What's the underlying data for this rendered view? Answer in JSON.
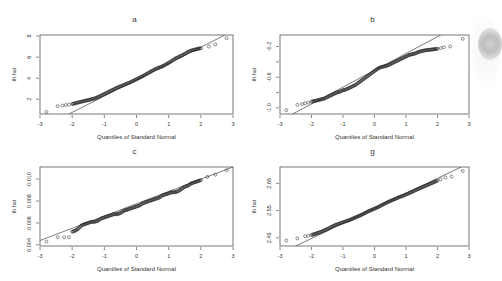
{
  "figure": {
    "layout": "2x2 grid of normal Q-Q plots",
    "colors": {
      "frame": "#555555",
      "points": "#222222",
      "line": "#444444",
      "text": "#333333"
    }
  },
  "chart_data": [
    {
      "type": "scatter",
      "panel": "a",
      "title": "a",
      "xlabel": "Quantiles of Standard Normal",
      "ylabel": "th.hat",
      "xlim": [
        -3,
        3
      ],
      "ylim": [
        0.6,
        8.1
      ],
      "xticks": [
        "-3",
        "-2",
        "-1",
        "0",
        "1",
        "2",
        "3"
      ],
      "yticks": [
        "2",
        "4",
        "6",
        "8"
      ],
      "reference_line": {
        "x": [
          -2.1,
          2.75
        ],
        "y": [
          0.6,
          8.1
        ]
      },
      "points_summary": "Q-Q points from about (-2.8, 0.8) to (2.8, 7.8); lower tail flatter than line, near-linear center, upper tail slightly below line",
      "points": [
        [
          -2.8,
          0.8
        ],
        [
          -2.45,
          1.35
        ],
        [
          -2.3,
          1.4
        ],
        [
          -2.2,
          1.45
        ],
        [
          -2.1,
          1.5
        ],
        [
          -2.0,
          1.55
        ],
        [
          -1.9,
          1.62
        ],
        [
          -1.8,
          1.7
        ],
        [
          -1.7,
          1.78
        ],
        [
          -1.6,
          1.85
        ],
        [
          -1.5,
          1.92
        ],
        [
          -1.4,
          2.0
        ],
        [
          -1.3,
          2.08
        ],
        [
          -1.2,
          2.2
        ],
        [
          -1.1,
          2.35
        ],
        [
          -1.0,
          2.5
        ],
        [
          -0.9,
          2.65
        ],
        [
          -0.8,
          2.8
        ],
        [
          -0.7,
          2.95
        ],
        [
          -0.6,
          3.1
        ],
        [
          -0.5,
          3.22
        ],
        [
          -0.4,
          3.35
        ],
        [
          -0.3,
          3.48
        ],
        [
          -0.2,
          3.6
        ],
        [
          -0.1,
          3.75
        ],
        [
          0.0,
          3.9
        ],
        [
          0.1,
          4.05
        ],
        [
          0.2,
          4.2
        ],
        [
          0.3,
          4.38
        ],
        [
          0.4,
          4.55
        ],
        [
          0.5,
          4.72
        ],
        [
          0.6,
          4.88
        ],
        [
          0.7,
          5.0
        ],
        [
          0.8,
          5.12
        ],
        [
          0.9,
          5.28
        ],
        [
          1.0,
          5.45
        ],
        [
          1.1,
          5.65
        ],
        [
          1.2,
          5.85
        ],
        [
          1.3,
          6.0
        ],
        [
          1.4,
          6.15
        ],
        [
          1.5,
          6.3
        ],
        [
          1.6,
          6.5
        ],
        [
          1.7,
          6.62
        ],
        [
          1.8,
          6.7
        ],
        [
          1.9,
          6.78
        ],
        [
          2.0,
          6.85
        ],
        [
          2.25,
          7.0
        ],
        [
          2.45,
          7.2
        ],
        [
          2.8,
          7.8
        ]
      ]
    },
    {
      "type": "scatter",
      "panel": "b",
      "title": "b",
      "xlabel": "Quantiles of Standard Normal",
      "ylabel": "th.hat",
      "xlim": [
        -3,
        3
      ],
      "ylim": [
        -1.08,
        -0.05
      ],
      "xticks": [
        "-3",
        "-2",
        "-1",
        "0",
        "1",
        "2",
        "3"
      ],
      "yticks": [
        "-1.0",
        "-0.6",
        "-0.2"
      ],
      "yticks_minor": [
        "-0.8",
        "-0.4"
      ],
      "reference_line": {
        "x": [
          -2.6,
          2.1
        ],
        "y": [
          -1.08,
          -0.05
        ]
      },
      "points_summary": "Q-Q points from about (-2.8, -1.03) to (2.8, -0.1); upper tail bends below reference line",
      "points": [
        [
          -2.8,
          -1.03
        ],
        [
          -2.45,
          -0.96
        ],
        [
          -2.3,
          -0.95
        ],
        [
          -2.2,
          -0.94
        ],
        [
          -2.1,
          -0.93
        ],
        [
          -2.0,
          -0.92
        ],
        [
          -1.9,
          -0.91
        ],
        [
          -1.8,
          -0.9
        ],
        [
          -1.7,
          -0.89
        ],
        [
          -1.6,
          -0.88
        ],
        [
          -1.5,
          -0.86
        ],
        [
          -1.4,
          -0.84
        ],
        [
          -1.3,
          -0.82
        ],
        [
          -1.2,
          -0.8
        ],
        [
          -1.1,
          -0.79
        ],
        [
          -1.0,
          -0.77
        ],
        [
          -0.9,
          -0.76
        ],
        [
          -0.8,
          -0.74
        ],
        [
          -0.7,
          -0.72
        ],
        [
          -0.6,
          -0.7
        ],
        [
          -0.5,
          -0.67
        ],
        [
          -0.4,
          -0.64
        ],
        [
          -0.3,
          -0.61
        ],
        [
          -0.2,
          -0.58
        ],
        [
          -0.1,
          -0.55
        ],
        [
          0.0,
          -0.52
        ],
        [
          0.1,
          -0.49
        ],
        [
          0.2,
          -0.47
        ],
        [
          0.3,
          -0.46
        ],
        [
          0.4,
          -0.45
        ],
        [
          0.5,
          -0.43
        ],
        [
          0.6,
          -0.41
        ],
        [
          0.7,
          -0.39
        ],
        [
          0.8,
          -0.37
        ],
        [
          0.9,
          -0.35
        ],
        [
          1.0,
          -0.33
        ],
        [
          1.1,
          -0.31
        ],
        [
          1.2,
          -0.3
        ],
        [
          1.3,
          -0.29
        ],
        [
          1.4,
          -0.27
        ],
        [
          1.5,
          -0.26
        ],
        [
          1.6,
          -0.25
        ],
        [
          1.7,
          -0.245
        ],
        [
          1.8,
          -0.24
        ],
        [
          1.9,
          -0.235
        ],
        [
          2.0,
          -0.23
        ],
        [
          2.1,
          -0.22
        ],
        [
          2.2,
          -0.21
        ],
        [
          2.4,
          -0.2
        ],
        [
          2.8,
          -0.1
        ]
      ]
    },
    {
      "type": "scatter",
      "panel": "c",
      "title": "c",
      "xlabel": "Quantiles of Standard Normal",
      "ylabel": "th.hat",
      "xlim": [
        -3,
        3
      ],
      "ylim": [
        0.0039,
        0.0111
      ],
      "xticks": [
        "-3",
        "-2",
        "-1",
        "0",
        "1",
        "2",
        "3"
      ],
      "yticks": [
        "0.004",
        "0.006",
        "0.008",
        "0.010"
      ],
      "reference_line": {
        "x": [
          -3.0,
          3.0
        ],
        "y": [
          0.0044,
          0.0111
        ]
      },
      "points_summary": "Q-Q points closely follow the reference line from about (-2.8, 0.0043) to (2.8, 0.0109)",
      "points": [
        [
          -2.8,
          0.0043
        ],
        [
          -2.45,
          0.0047
        ],
        [
          -2.25,
          0.0047
        ],
        [
          -2.1,
          0.0047
        ],
        [
          -2.0,
          0.0052
        ],
        [
          -1.9,
          0.0053
        ],
        [
          -1.8,
          0.0055
        ],
        [
          -1.7,
          0.0058
        ],
        [
          -1.6,
          0.0059
        ],
        [
          -1.5,
          0.006
        ],
        [
          -1.4,
          0.0061
        ],
        [
          -1.3,
          0.0061
        ],
        [
          -1.2,
          0.0062
        ],
        [
          -1.1,
          0.0064
        ],
        [
          -1.0,
          0.0065
        ],
        [
          -0.9,
          0.0066
        ],
        [
          -0.8,
          0.0067
        ],
        [
          -0.7,
          0.0068
        ],
        [
          -0.6,
          0.0068
        ],
        [
          -0.5,
          0.0069
        ],
        [
          -0.4,
          0.0071
        ],
        [
          -0.3,
          0.0072
        ],
        [
          -0.2,
          0.0073
        ],
        [
          -0.1,
          0.0074
        ],
        [
          0.0,
          0.0075
        ],
        [
          0.1,
          0.0076
        ],
        [
          0.2,
          0.0078
        ],
        [
          0.3,
          0.0079
        ],
        [
          0.4,
          0.008
        ],
        [
          0.5,
          0.0081
        ],
        [
          0.6,
          0.0082
        ],
        [
          0.7,
          0.0083
        ],
        [
          0.8,
          0.0085
        ],
        [
          0.9,
          0.0086
        ],
        [
          1.0,
          0.0087
        ],
        [
          1.1,
          0.0088
        ],
        [
          1.2,
          0.0088
        ],
        [
          1.3,
          0.0089
        ],
        [
          1.4,
          0.0091
        ],
        [
          1.5,
          0.0093
        ],
        [
          1.6,
          0.0094
        ],
        [
          1.7,
          0.0096
        ],
        [
          1.8,
          0.0097
        ],
        [
          1.9,
          0.0098
        ],
        [
          2.0,
          0.0099
        ],
        [
          2.2,
          0.0102
        ],
        [
          2.45,
          0.0104
        ],
        [
          2.8,
          0.0108
        ]
      ]
    },
    {
      "type": "scatter",
      "panel": "g",
      "title": "g",
      "xlabel": "Quantiles of Standard Normal",
      "ylabel": "th.hat",
      "xlim": [
        -3,
        3
      ],
      "ylim": [
        2.42,
        2.71
      ],
      "xticks": [
        "-3",
        "-2",
        "-1",
        "0",
        "1",
        "2",
        "3"
      ],
      "yticks": [
        "2.45",
        "2.55",
        "2.65"
      ],
      "reference_line": {
        "x": [
          -2.5,
          2.75
        ],
        "y": [
          2.42,
          2.71
        ]
      },
      "points_summary": "Q-Q points near-linear from about (-2.8, 2.44) to (2.8, 2.70); slight lower-tail lift above line",
      "points": [
        [
          -2.8,
          2.44
        ],
        [
          -2.45,
          2.448
        ],
        [
          -2.2,
          2.456
        ],
        [
          -2.1,
          2.458
        ],
        [
          -2.0,
          2.46
        ],
        [
          -1.9,
          2.464
        ],
        [
          -1.8,
          2.468
        ],
        [
          -1.7,
          2.472
        ],
        [
          -1.6,
          2.477
        ],
        [
          -1.5,
          2.482
        ],
        [
          -1.4,
          2.488
        ],
        [
          -1.3,
          2.494
        ],
        [
          -1.2,
          2.499
        ],
        [
          -1.1,
          2.503
        ],
        [
          -1.0,
          2.507
        ],
        [
          -0.9,
          2.511
        ],
        [
          -0.8,
          2.515
        ],
        [
          -0.7,
          2.52
        ],
        [
          -0.6,
          2.525
        ],
        [
          -0.5,
          2.53
        ],
        [
          -0.4,
          2.535
        ],
        [
          -0.3,
          2.541
        ],
        [
          -0.2,
          2.547
        ],
        [
          -0.1,
          2.552
        ],
        [
          0.0,
          2.557
        ],
        [
          0.1,
          2.562
        ],
        [
          0.2,
          2.568
        ],
        [
          0.3,
          2.574
        ],
        [
          0.4,
          2.58
        ],
        [
          0.5,
          2.585
        ],
        [
          0.6,
          2.59
        ],
        [
          0.7,
          2.595
        ],
        [
          0.8,
          2.6
        ],
        [
          0.9,
          2.604
        ],
        [
          1.0,
          2.609
        ],
        [
          1.1,
          2.614
        ],
        [
          1.2,
          2.619
        ],
        [
          1.3,
          2.625
        ],
        [
          1.4,
          2.63
        ],
        [
          1.5,
          2.635
        ],
        [
          1.6,
          2.64
        ],
        [
          1.7,
          2.645
        ],
        [
          1.8,
          2.65
        ],
        [
          1.9,
          2.655
        ],
        [
          2.0,
          2.66
        ],
        [
          2.1,
          2.665
        ],
        [
          2.25,
          2.672
        ],
        [
          2.45,
          2.675
        ],
        [
          2.8,
          2.695
        ]
      ]
    }
  ]
}
